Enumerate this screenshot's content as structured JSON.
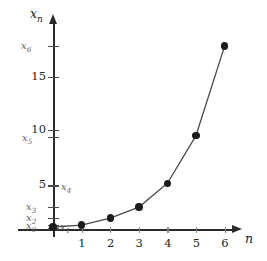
{
  "chart_data": {
    "type": "line",
    "title": "",
    "subtitle": "",
    "xlabel": "n",
    "ylabel": "x_n",
    "x": [
      0,
      1,
      2,
      3,
      4,
      5,
      6
    ],
    "values": [
      0.3,
      0.5,
      1.2,
      2.3,
      4.7,
      9.5,
      18.5
    ],
    "point_labels": [
      "x₀",
      "x₁",
      "x₂",
      "x₃",
      "x₄",
      "x₅",
      "x₆"
    ],
    "xlim": [
      -0.35,
      6.9
    ],
    "ylim": [
      0,
      21.5
    ],
    "xticks": [
      1,
      2,
      3,
      4,
      5,
      6
    ],
    "xticklabels": [
      "1",
      "2",
      "3",
      "4",
      "5",
      "6"
    ],
    "yticks": [
      0.3,
      0.5,
      1.2,
      2.3,
      4.7,
      5,
      9.5,
      10,
      15,
      18.5
    ],
    "yticklabels": [
      "x₀",
      "x₁",
      "x₂",
      "x₃",
      "x₄",
      "5",
      "x₅",
      "10",
      "15",
      "x₆"
    ],
    "grid": false,
    "legend": null,
    "marker": "filled-circle",
    "line_color": "#4a4a4a",
    "marker_color": "#1c1c1c",
    "axis_color": "#2b2b2b"
  },
  "axes": {
    "y_axis_name": "x",
    "y_axis_name_sub": "n",
    "x_axis_name": "n"
  },
  "y_labels": {
    "x6": {
      "base": "x",
      "sub": "6"
    },
    "t15": "15",
    "t10": "10",
    "x5": {
      "base": "x",
      "sub": "5"
    },
    "t5": "5",
    "x4": {
      "base": "x",
      "sub": "4"
    },
    "x3": {
      "base": "x",
      "sub": "3"
    },
    "x2": {
      "base": "x",
      "sub": "2"
    },
    "x1": {
      "base": "x",
      "sub": "1"
    },
    "x0": {
      "base": "x",
      "sub": "0"
    }
  },
  "x_labels": {
    "t1": "1",
    "t2": "2",
    "t3": "3",
    "t4": "4",
    "t5": "5",
    "t6": "6"
  },
  "colors": {
    "axis": "#2b2b2b",
    "marker": "#1c1c1c",
    "line": "#4a4a4a",
    "label_muted": "#5f5f5f",
    "background": "#ffffff"
  }
}
